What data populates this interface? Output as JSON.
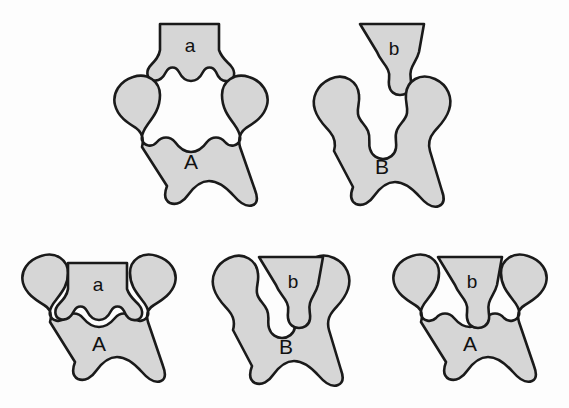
{
  "figure": {
    "background_color": "#fdfdfd",
    "shape_fill_color": "#d6d6d6",
    "shape_stroke_color": "#1a1a1a"
  },
  "rows": [
    {
      "name": "unbound-row",
      "description": "Keys shown separated above their locks",
      "panels": [
        {
          "name": "panel-a-separate",
          "key_label": "a",
          "lock_label": "A",
          "state": "separated"
        },
        {
          "name": "panel-b-separate",
          "key_label": "b",
          "lock_label": "B",
          "state": "separated"
        }
      ]
    },
    {
      "name": "bound-row",
      "description": "Keys inserted into locks",
      "panels": [
        {
          "name": "panel-a-in-a",
          "key_label": "a",
          "lock_label": "A",
          "state": "complementary-fit"
        },
        {
          "name": "panel-b-in-b",
          "key_label": "b",
          "lock_label": "B",
          "state": "complementary-fit"
        },
        {
          "name": "panel-b-in-a",
          "key_label": "b",
          "lock_label": "A",
          "state": "poor-fit"
        }
      ]
    }
  ],
  "labels": {
    "top_key_a": "a",
    "top_lock_a": "A",
    "top_key_b": "b",
    "top_lock_b": "B",
    "bottom1_key": "a",
    "bottom1_lock": "A",
    "bottom2_key": "b",
    "bottom2_lock": "B",
    "bottom3_key": "b",
    "bottom3_lock": "A"
  }
}
